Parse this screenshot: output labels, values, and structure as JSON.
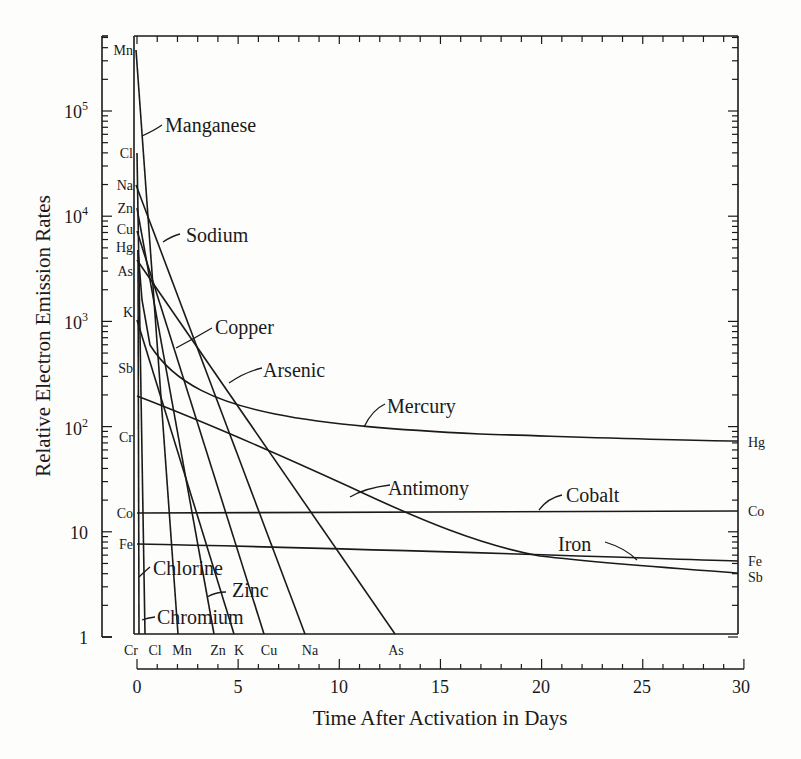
{
  "chart_data": {
    "type": "line",
    "title": "",
    "xlabel": "Time After Activation in Days",
    "ylabel": "Relative Electron Emission Rates",
    "yscale": "log",
    "xlim": [
      0,
      30
    ],
    "ylim": [
      1,
      500000
    ],
    "x_ticks": [
      0,
      5,
      10,
      15,
      20,
      25,
      30
    ],
    "y_ticks": [
      {
        "value": 1,
        "label": "1"
      },
      {
        "value": 10,
        "label": "10"
      },
      {
        "value": 100,
        "label": "10²"
      },
      {
        "value": 1000,
        "label": "10³"
      },
      {
        "value": 10000,
        "label": "10⁴"
      },
      {
        "value": 100000,
        "label": "10⁵"
      }
    ],
    "grid": false,
    "legend": "inline labels",
    "series": [
      {
        "name": "Manganese",
        "symbol": "Mn",
        "points": [
          [
            0,
            380000
          ],
          [
            2.1,
            1
          ]
        ]
      },
      {
        "name": "Chlorine",
        "symbol": "Cl",
        "points": [
          [
            0,
            40000
          ],
          [
            0.4,
            1
          ]
        ]
      },
      {
        "name": "Sodium",
        "symbol": "Na",
        "points": [
          [
            0,
            20000
          ],
          [
            8.4,
            1
          ]
        ]
      },
      {
        "name": "Zinc",
        "symbol": "Zn",
        "points": [
          [
            0,
            12000
          ],
          [
            3.8,
            1
          ]
        ]
      },
      {
        "name": "Copper",
        "symbol": "Cu",
        "points": [
          [
            0,
            7000
          ],
          [
            6.4,
            1
          ]
        ]
      },
      {
        "name": "Mercury",
        "symbol": "Hg",
        "points": [
          [
            0,
            5000
          ],
          [
            1,
            800
          ],
          [
            3,
            200
          ],
          [
            5,
            120
          ],
          [
            10,
            95
          ],
          [
            20,
            85
          ],
          [
            30,
            70
          ]
        ]
      },
      {
        "name": "Arsenic",
        "symbol": "As",
        "points": [
          [
            0,
            3000
          ],
          [
            12.9,
            1
          ]
        ]
      },
      {
        "name": "Potassium",
        "symbol": "K",
        "points": [
          [
            0,
            1200
          ],
          [
            4.8,
            1
          ]
        ]
      },
      {
        "name": "Antimony",
        "symbol": "Sb",
        "points": [
          [
            0,
            200
          ],
          [
            5,
            60
          ],
          [
            10,
            25
          ],
          [
            15,
            10
          ],
          [
            20,
            6
          ],
          [
            25,
            4.8
          ],
          [
            30,
            4
          ]
        ]
      },
      {
        "name": "Chromium",
        "symbol": "Cr",
        "points": [
          [
            0,
            80
          ],
          [
            0.1,
            1
          ]
        ]
      },
      {
        "name": "Cobalt",
        "symbol": "Co",
        "points": [
          [
            0,
            15
          ],
          [
            30,
            15
          ]
        ]
      },
      {
        "name": "Iron",
        "symbol": "Fe",
        "points": [
          [
            0,
            7.6
          ],
          [
            30,
            5
          ]
        ]
      }
    ]
  },
  "labels": {
    "ylabel": "Relative Electron Emission Rates",
    "xlabel": "Time After Activation in Days",
    "series_names": {
      "manganese": "Manganese",
      "sodium": "Sodium",
      "copper": "Copper",
      "arsenic": "Arsenic",
      "mercury": "Mercury",
      "antimony": "Antimony",
      "cobalt": "Cobalt",
      "iron": "Iron",
      "chlorine": "Chlorine",
      "zinc": "Zinc",
      "chromium": "Chromium"
    },
    "left_symbols": [
      "Mn",
      "Cl",
      "Na",
      "Zn",
      "Cu",
      "Hg",
      "As",
      "K",
      "Sb",
      "Cr",
      "Co",
      "Fe"
    ],
    "right_symbols": [
      "Hg",
      "Co",
      "Fe",
      "Sb"
    ],
    "bottom_symbols": [
      "Cr",
      "Cl",
      "Mn",
      "Zn",
      "K",
      "Cu",
      "Na",
      "As"
    ],
    "y_tick_labels": [
      "10⁵",
      "10⁴",
      "10³",
      "10²",
      "10",
      "1"
    ],
    "x_tick_labels": [
      "0",
      "5",
      "10",
      "15",
      "20",
      "25",
      "30"
    ]
  }
}
